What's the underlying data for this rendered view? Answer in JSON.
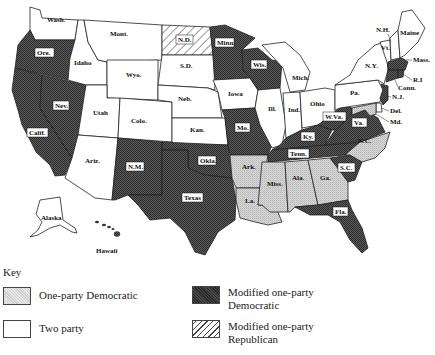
{
  "colors": {
    "one_party_democratic": "#cfcfcf",
    "two_party": "#ffffff",
    "modified_one_party_democratic": "#4a4a4a",
    "modified_one_party_republican": "hatched",
    "border": "#222222"
  },
  "states": {
    "wash": "Wash.",
    "ore": "Ore.",
    "calif": "Calif.",
    "nev": "Nev.",
    "idaho": "Idaho",
    "mont": "Mont.",
    "wyo": "Wyo.",
    "utah": "Utah",
    "colo": "Colo.",
    "ariz": "Ariz.",
    "nm": "N.M.",
    "nd": "N.D.",
    "sd": "S.D.",
    "neb": "Neb.",
    "kan": "Kan.",
    "okla": "Okla.",
    "texas": "Texas",
    "minn": "Minn.",
    "iowa": "Iowa",
    "mo": "Mo.",
    "ark": "Ark.",
    "la": "La.",
    "wis": "Wis.",
    "ill": "Ill.",
    "mich": "Mich.",
    "ind": "Ind.",
    "ohio": "Ohio",
    "ky": "Ky.",
    "tenn": "Tenn.",
    "miss": "Miss.",
    "ala": "Ala.",
    "ga": "Ga.",
    "fla": "Fla.",
    "sc": "S.C.",
    "nc": "N.C.",
    "va": "Va.",
    "wva": "W.Va.",
    "pa": "Pa.",
    "ny": "N.Y.",
    "vt": "Vt.",
    "nh": "N.H.",
    "maine": "Maine",
    "mass": "Mass.",
    "ri": "R.I",
    "conn": "Conn.",
    "nj": "N.J.",
    "del": "Del.",
    "md": "Md.",
    "alaska": "Alaska",
    "hawaii": "Hawaii"
  },
  "classification": {
    "one_party_democratic": [
      "Ark.",
      "La.",
      "Miss.",
      "Ala.",
      "Ga.",
      "N.C."
    ],
    "two_party": [
      "Wash.",
      "Idaho",
      "Mont.",
      "Wyo.",
      "Utah",
      "Colo.",
      "Ariz.",
      "S.D.",
      "Neb.",
      "Kan.",
      "Iowa",
      "Ill.",
      "Ind.",
      "Ohio",
      "Mich.",
      "Pa.",
      "N.Y.",
      "Vt.",
      "N.H.",
      "Maine",
      "Del.",
      "Md.",
      "Alaska"
    ],
    "modified_one_party_democratic": [
      "Ore.",
      "Calif.",
      "Nev.",
      "N.M.",
      "Okla.",
      "Texas",
      "Minn.",
      "Wis.",
      "Mo.",
      "Ky.",
      "Tenn.",
      "W.Va.",
      "Va.",
      "S.C.",
      "Fla.",
      "Mass.",
      "R.I",
      "Conn.",
      "N.J.",
      "Hawaii"
    ],
    "modified_one_party_republican": [
      "N.D."
    ]
  },
  "key": {
    "title": "Key",
    "items": [
      {
        "label": "One-party Democratic"
      },
      {
        "label": "Two party"
      },
      {
        "label": "Modified one-party Democratic"
      },
      {
        "label": "Modified one-party Republican"
      }
    ]
  }
}
